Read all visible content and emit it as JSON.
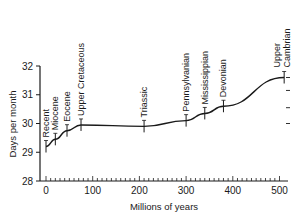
{
  "chart_data": {
    "type": "line",
    "title": "",
    "xlabel": "Millions of years",
    "ylabel": "Days per month",
    "xlim": [
      0,
      520
    ],
    "ylim": [
      28,
      32
    ],
    "grid": false,
    "legend": null,
    "x_ticks": [
      "0",
      "100",
      "200",
      "300",
      "400",
      "500"
    ],
    "y_ticks": [
      "28",
      "29",
      "30",
      "31",
      "32"
    ],
    "series": [
      {
        "name": "Days per month",
        "x": [
          0,
          20,
          45,
          75,
          210,
          300,
          340,
          380,
          510
        ],
        "y": [
          29.2,
          29.45,
          29.75,
          29.95,
          29.9,
          30.1,
          30.35,
          30.6,
          31.6
        ]
      }
    ],
    "annotations": [
      {
        "label": "Recent",
        "x": 0,
        "y": 29.2
      },
      {
        "label": "Miocene",
        "x": 20,
        "y": 29.45
      },
      {
        "label": "Eocene",
        "x": 45,
        "y": 29.75
      },
      {
        "label": "Upper Cretaceous",
        "x": 75,
        "y": 29.95
      },
      {
        "label": "Triassic",
        "x": 210,
        "y": 29.9
      },
      {
        "label": "Pennsylvanian",
        "x": 300,
        "y": 30.1
      },
      {
        "label": "Mississippian",
        "x": 340,
        "y": 30.35
      },
      {
        "label": "Devonian",
        "x": 380,
        "y": 30.6
      },
      {
        "label": "Upper Cambrian",
        "x": 510,
        "y": 31.6
      }
    ]
  }
}
